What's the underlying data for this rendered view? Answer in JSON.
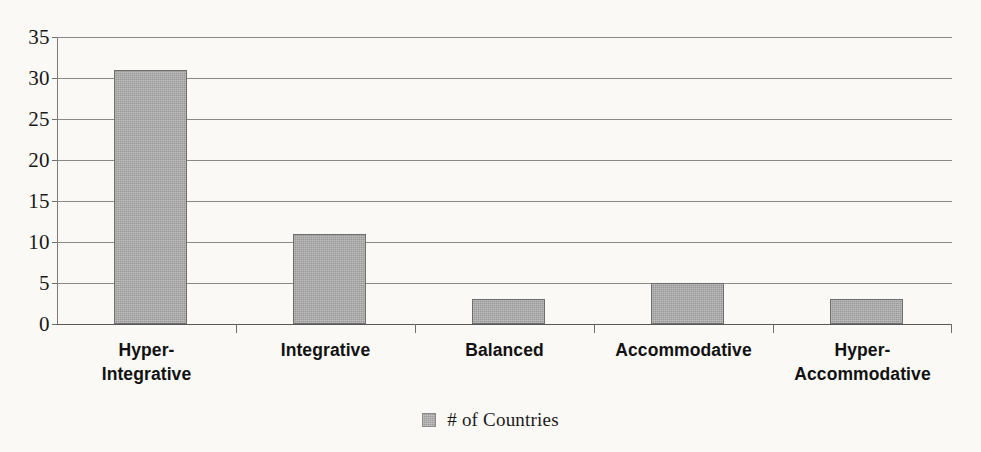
{
  "chart_data": {
    "type": "bar",
    "title": "",
    "xlabel": "",
    "ylabel": "",
    "categories": [
      "Hyper-\nIntegrative",
      "Integrative",
      "Balanced",
      "Accommodative",
      "Hyper-\nAccommodative"
    ],
    "values": [
      31,
      11,
      3,
      5,
      3
    ],
    "series": [
      {
        "name": "# of Countries",
        "values": [
          31,
          11,
          3,
          5,
          3
        ]
      }
    ],
    "ylim": [
      0,
      35
    ],
    "ytick_labels": [
      "0",
      "5",
      "10",
      "15",
      "20",
      "25",
      "30",
      "35"
    ],
    "ytick_values": [
      0,
      5,
      10,
      15,
      20,
      25,
      30,
      35
    ],
    "grid": true,
    "legend": {
      "position": "bottom",
      "entries": [
        {
          "label": "# of Countries",
          "color": "#989898"
        }
      ]
    },
    "colors": {
      "bar_fill": "#989898",
      "bar_border": "#6e6e6e",
      "gridline": "#8b8b85",
      "axis": "#6f6f69",
      "background": "#faf9f6",
      "text": "#111111"
    }
  }
}
